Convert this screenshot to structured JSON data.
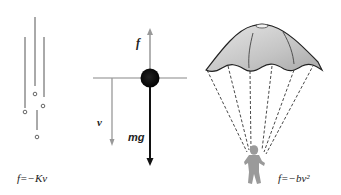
{
  "diagram": {
    "panels": [
      {
        "id": "raindrops",
        "description": "Falling droplets with linear drag",
        "equation": "f=−Kv"
      },
      {
        "id": "free-body",
        "description": "Free-body diagram of a falling ball",
        "labels": {
          "drag_force": "f",
          "velocity": "v",
          "weight": "mg"
        }
      },
      {
        "id": "parachute",
        "description": "Parachutist with quadratic drag",
        "equation": "f=−bv²"
      }
    ]
  },
  "colors": {
    "ink": "#1a1a1a",
    "gray_line": "#888888",
    "canopy_fill": "#c8c8c8",
    "person": "#9a9a9a"
  }
}
